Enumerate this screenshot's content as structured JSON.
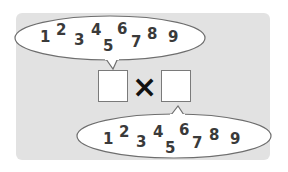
{
  "problem": {
    "operator": "×",
    "left_box_value": "",
    "right_box_value": ""
  },
  "top_bubble": {
    "digits": [
      "1",
      "2",
      "3",
      "4",
      "5",
      "6",
      "7",
      "8",
      "9"
    ]
  },
  "bottom_bubble": {
    "digits": [
      "1",
      "2",
      "3",
      "4",
      "5",
      "6",
      "7",
      "8",
      "9"
    ]
  },
  "colors": {
    "panel": "#e2e2e2",
    "bubble_fill": "#ffffff",
    "bubble_stroke": "#6e6e6e",
    "digit": "#3a3a3a",
    "operator": "#111111"
  }
}
